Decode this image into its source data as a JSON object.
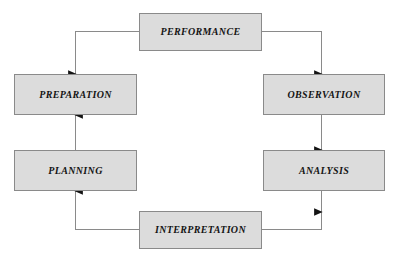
{
  "diagram": {
    "type": "cyclical-flow-diagram",
    "colors": {
      "background": "#ffffff",
      "node_fill": "#dcdcdc",
      "node_border": "#8a8a8a",
      "connector": "#8a8a8a",
      "arrowhead": "#141414",
      "label_text": "#141414"
    },
    "nodes": [
      {
        "id": "performance",
        "label": "PERFORMANCE"
      },
      {
        "id": "observation",
        "label": "OBSERVATION"
      },
      {
        "id": "analysis",
        "label": "ANALYSIS"
      },
      {
        "id": "interpretation",
        "label": "INTERPRETATION"
      },
      {
        "id": "planning",
        "label": "PLANNING"
      },
      {
        "id": "preparation",
        "label": "PREPARATION"
      }
    ],
    "edges": [
      {
        "from": "performance",
        "to": "observation",
        "direction": "down",
        "side": "right"
      },
      {
        "from": "observation",
        "to": "analysis",
        "direction": "down",
        "side": "right"
      },
      {
        "from": "analysis",
        "to": "interpretation",
        "direction": "down",
        "side": "right"
      },
      {
        "from": "interpretation",
        "to": "planning",
        "direction": "up",
        "side": "left"
      },
      {
        "from": "planning",
        "to": "preparation",
        "direction": "up",
        "side": "left"
      },
      {
        "from": "preparation",
        "to": "performance",
        "direction": "up",
        "side": "left"
      }
    ],
    "flow_order": "clockwise"
  }
}
